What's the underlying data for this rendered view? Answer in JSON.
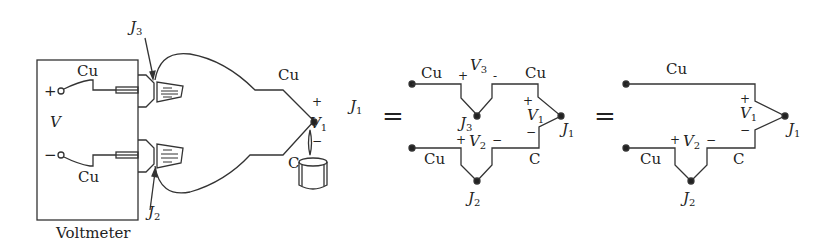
{
  "left": {
    "voltmeter_label": "Voltmeter",
    "v_label": "V",
    "plus": "+",
    "minus": "−",
    "wire_top": "Cu",
    "wire_bottom": "Cu",
    "j3": "J",
    "j3_sub": "3",
    "j2": "J",
    "j2_sub": "2",
    "probe_top_wire": "Cu",
    "probe_bottom_wire": "C",
    "v1": "V",
    "v1_sub": "1",
    "v1_plus": "+",
    "v1_minus": "−",
    "j1": "J",
    "j1_sub": "1"
  },
  "equals": "=",
  "middle": {
    "cu_top_left": "Cu",
    "cu_top_right": "Cu",
    "v3": "V",
    "v3_sub": "3",
    "v3_plus": "+",
    "v3_minus": "-",
    "j3": "J",
    "j3_sub": "3",
    "v1": "V",
    "v1_sub": "1",
    "v1_plus": "+",
    "v1_minus": "−",
    "j1": "J",
    "j1_sub": "1",
    "v2": "V",
    "v2_sub": "2",
    "v2_plus": "+",
    "v2_minus": "−",
    "cu_bottom": "Cu",
    "c_bottom": "C",
    "j2": "J",
    "j2_sub": "2"
  },
  "right": {
    "cu_top": "Cu",
    "v1": "V",
    "v1_sub": "1",
    "v1_plus": "+",
    "v1_minus": "−",
    "j1": "J",
    "j1_sub": "1",
    "v2": "V",
    "v2_sub": "2",
    "v2_plus": "+",
    "v2_minus": "−",
    "cu_bottom": "Cu",
    "c_bottom": "C",
    "j2": "J",
    "j2_sub": "2"
  }
}
